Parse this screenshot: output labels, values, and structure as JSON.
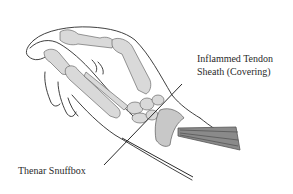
{
  "diagram": {
    "labels": [
      {
        "id": "tendon",
        "line1": "Inflammed Tendon",
        "line2": "Sheath (Covering)"
      },
      {
        "id": "snuffbox",
        "text": "Thenar Snuffbox"
      }
    ],
    "colors": {
      "background": "#ffffff",
      "outline": "#2a2a2a",
      "bone_fill": "#d9d9d9",
      "shadow": "#9a9a9a",
      "text": "#2a2a2a"
    }
  }
}
